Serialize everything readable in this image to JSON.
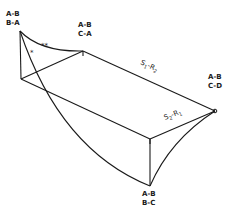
{
  "diagram": {
    "vertices": [
      {
        "id": "v1",
        "label_top": "A-B",
        "label_bottom": "B-A"
      },
      {
        "id": "v2",
        "label_top": "A-B",
        "label_bottom": "C-A",
        "marker": "1"
      },
      {
        "id": "v3",
        "label_top": "A-B",
        "label_bottom": "C-D",
        "marker": "0"
      },
      {
        "id": "v4",
        "label_top": "A-B",
        "label_bottom": "B-C"
      },
      {
        "id": "v5",
        "marker": "1"
      }
    ],
    "edge_labels": {
      "upper": {
        "main": "S",
        "sub1": "1",
        "dash": "-R",
        "sub2": "2"
      },
      "lower": {
        "main": "S",
        "sub1": "2",
        "dash": "-R",
        "sub2": "1"
      }
    },
    "curve_markers": {
      "single": "*",
      "double": "**"
    }
  }
}
